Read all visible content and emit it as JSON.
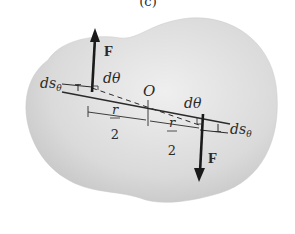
{
  "figure": {
    "caption_fragment": "(c)",
    "bottom_caption_fragment": ""
  },
  "labels": {
    "force_top": "F",
    "force_bottom": "F",
    "dtheta_left": "dθ",
    "dtheta_right": "dθ",
    "origin": "O",
    "ds_left": "ds",
    "ds_left_sub": "θ",
    "ds_right": "ds",
    "ds_right_sub": "θ",
    "r_left_num": "r",
    "r_left_den": "2",
    "r_right_num": "r",
    "r_right_den": "2"
  },
  "colors": {
    "body_fill": "#d9d9d9",
    "body_fill_center": "#ececec",
    "ink": "#2a2a2a"
  }
}
